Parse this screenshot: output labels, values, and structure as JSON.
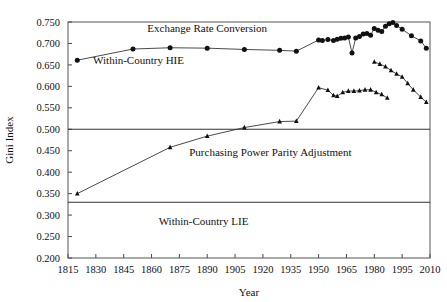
{
  "chart_data": {
    "type": "line",
    "title": "",
    "xlabel": "Year",
    "ylabel": "Gini Index",
    "xlim": [
      1815,
      2010
    ],
    "ylim": [
      0.2,
      0.75
    ],
    "grid": false,
    "legend": "none",
    "xticks": [
      1815,
      1830,
      1845,
      1860,
      1875,
      1890,
      1905,
      1920,
      1935,
      1950,
      1965,
      1980,
      1995,
      2010
    ],
    "yticks": [
      "0.200",
      "0.250",
      "0.300",
      "0.350",
      "0.400",
      "0.450",
      "0.500",
      "0.550",
      "0.600",
      "0.650",
      "0.700",
      "0.750"
    ],
    "reference_lines": [
      {
        "value": 0.5,
        "label": "boundary-upper"
      },
      {
        "value": 0.33,
        "label": "boundary-lower"
      }
    ],
    "annotations": [
      {
        "text": "Exchange Rate Conversion",
        "x": 1890,
        "y": 0.727
      },
      {
        "text": "Within-Country HIE",
        "x": 1853,
        "y": 0.651
      },
      {
        "text": "Purchasing Power Parity Adjustment",
        "x": 1924,
        "y": 0.437
      },
      {
        "text": "Within-Country LIE",
        "x": 1888,
        "y": 0.277
      }
    ],
    "series": [
      {
        "name": "Exchange Rate Conversion",
        "marker": "circle",
        "color": "#111111",
        "points": [
          [
            1820,
            0.661
          ],
          [
            1850,
            0.687
          ],
          [
            1870,
            0.69
          ],
          [
            1890,
            0.689
          ],
          [
            1910,
            0.686
          ],
          [
            1929,
            0.684
          ],
          [
            1938,
            0.682
          ],
          [
            1950,
            0.708
          ],
          [
            1952,
            0.707
          ],
          [
            1955,
            0.709
          ],
          [
            1958,
            0.707
          ],
          [
            1960,
            0.71
          ],
          [
            1962,
            0.712
          ],
          [
            1964,
            0.713
          ],
          [
            1966,
            0.715
          ],
          [
            1968,
            0.678
          ],
          [
            1970,
            0.713
          ],
          [
            1972,
            0.716
          ],
          [
            1974,
            0.722
          ],
          [
            1976,
            0.723
          ],
          [
            1978,
            0.719
          ],
          [
            1980,
            0.735
          ],
          [
            1982,
            0.731
          ],
          [
            1984,
            0.728
          ],
          [
            1986,
            0.74
          ],
          [
            1988,
            0.746
          ],
          [
            1990,
            0.749
          ],
          [
            1992,
            0.742
          ],
          [
            1995,
            0.733
          ],
          [
            2000,
            0.718
          ],
          [
            2005,
            0.706
          ],
          [
            2008,
            0.689
          ]
        ]
      },
      {
        "name": "Exchange Rate Conversion Within-Country HIE",
        "marker": "triangle",
        "color": "#111111",
        "points": [
          [
            1980,
            0.657
          ],
          [
            1983,
            0.652
          ],
          [
            1986,
            0.646
          ],
          [
            1989,
            0.637
          ],
          [
            1992,
            0.629
          ],
          [
            1995,
            0.622
          ],
          [
            1998,
            0.607
          ],
          [
            2001,
            0.592
          ],
          [
            2005,
            0.575
          ],
          [
            2008,
            0.563
          ]
        ]
      },
      {
        "name": "Purchasing Power Parity Adjustment",
        "marker": "triangle",
        "color": "#111111",
        "points": [
          [
            1820,
            0.35
          ],
          [
            1870,
            0.458
          ],
          [
            1890,
            0.484
          ],
          [
            1910,
            0.504
          ],
          [
            1929,
            0.518
          ],
          [
            1938,
            0.519
          ],
          [
            1950,
            0.597
          ],
          [
            1955,
            0.591
          ],
          [
            1958,
            0.579
          ],
          [
            1960,
            0.577
          ],
          [
            1963,
            0.586
          ],
          [
            1966,
            0.589
          ],
          [
            1969,
            0.589
          ],
          [
            1972,
            0.59
          ],
          [
            1975,
            0.592
          ],
          [
            1978,
            0.592
          ],
          [
            1981,
            0.586
          ],
          [
            1984,
            0.581
          ],
          [
            1987,
            0.573
          ]
        ]
      }
    ]
  },
  "axes": {
    "ylabel": "Gini Index",
    "xlabel": "Year"
  }
}
